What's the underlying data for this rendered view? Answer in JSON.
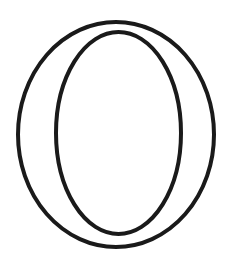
{
  "image": {
    "subject": "outlined letter O",
    "background": "#ffffff",
    "stroke_color": "#1a1a1a",
    "stroke_width": 4,
    "outer_ellipse": {
      "cx": 116,
      "cy": 134.5,
      "rx": 98,
      "ry": 112.5
    },
    "inner_ellipse": {
      "cx": 118.5,
      "cy": 133,
      "rx": 62.5,
      "ry": 101
    }
  }
}
